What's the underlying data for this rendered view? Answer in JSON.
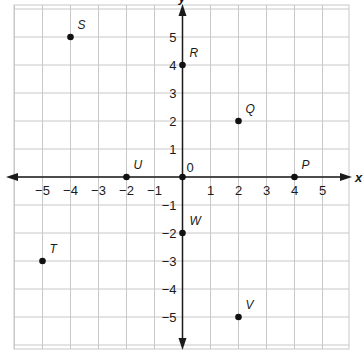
{
  "chart_data": {
    "type": "scatter",
    "title": "",
    "xlabel": "x",
    "ylabel": "y",
    "xlim": [
      -6,
      6
    ],
    "ylim": [
      -6,
      6
    ],
    "grid": true,
    "x_ticks": [
      -5,
      -4,
      -3,
      -2,
      -1,
      1,
      2,
      3,
      4,
      5
    ],
    "y_ticks": [
      -5,
      -4,
      -3,
      -2,
      -1,
      1,
      2,
      3,
      4,
      5
    ],
    "origin_label": "0",
    "points": [
      {
        "label": "S",
        "x": -4,
        "y": 5
      },
      {
        "label": "R",
        "x": 0,
        "y": 4
      },
      {
        "label": "Q",
        "x": 2,
        "y": 2
      },
      {
        "label": "U",
        "x": -2,
        "y": 0
      },
      {
        "label": "O",
        "x": 0,
        "y": 0,
        "show_label": false
      },
      {
        "label": "P",
        "x": 4,
        "y": 0
      },
      {
        "label": "W",
        "x": 0,
        "y": -2
      },
      {
        "label": "T",
        "x": -5,
        "y": -3
      },
      {
        "label": "V",
        "x": 2,
        "y": -5
      }
    ]
  },
  "layout": {
    "origin_px": [
      182.5,
      177
    ],
    "unit_px": 28,
    "grid_bounds_px": {
      "left": 14,
      "right": 349,
      "top": 5,
      "bottom": 349
    },
    "x_axis_px": {
      "left": 6,
      "right": 352
    },
    "y_axis_px": {
      "top": 4,
      "bottom": 350
    },
    "colors": {
      "grid": "#c8c8c8",
      "axis": "#1a1a1a",
      "point": "#111111"
    }
  }
}
